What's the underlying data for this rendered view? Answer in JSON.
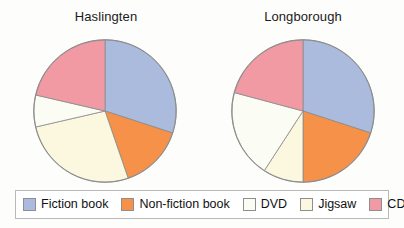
{
  "charts": [
    {
      "title": "Haslingten"
    },
    {
      "title": "Longborough"
    }
  ],
  "legend": {
    "items": [
      {
        "label": "Fiction book",
        "color": "#aabbdd"
      },
      {
        "label": "Non-fiction book",
        "color": "#f59149"
      },
      {
        "label": "DVD",
        "color": "#fbfdf5"
      },
      {
        "label": "Jigsaw",
        "color": "#fcf8e0"
      },
      {
        "label": "CD",
        "color": "#f29aa4"
      }
    ]
  },
  "chart_data": [
    {
      "type": "pie",
      "title": "Haslingten",
      "categories": [
        "Fiction book",
        "Non-fiction book",
        "Jigsaw",
        "DVD",
        "CD"
      ],
      "values": [
        30,
        15,
        26.5,
        7,
        21.5
      ],
      "units": "percent",
      "start_angle_deg": 0,
      "direction": "clockwise",
      "colors": [
        "#aabbdd",
        "#f59149",
        "#fcf8e0",
        "#fbfdf5",
        "#f29aa4"
      ],
      "slice_angles_deg": [
        {
          "name": "Fiction book",
          "start": 0,
          "end": 108
        },
        {
          "name": "Non-fiction book",
          "start": 108,
          "end": 161
        },
        {
          "name": "Jigsaw",
          "start": 161,
          "end": 257
        },
        {
          "name": "DVD",
          "start": 257,
          "end": 283
        },
        {
          "name": "CD",
          "start": 283,
          "end": 360
        }
      ],
      "legend_position": "bottom"
    },
    {
      "type": "pie",
      "title": "Longborough",
      "categories": [
        "Fiction book",
        "Non-fiction book",
        "Jigsaw",
        "DVD",
        "CD"
      ],
      "values": [
        30,
        20,
        9,
        20,
        21
      ],
      "units": "percent",
      "start_angle_deg": 0,
      "direction": "clockwise",
      "colors": [
        "#aabbdd",
        "#f59149",
        "#fcf8e0",
        "#fbfdf5",
        "#f29aa4"
      ],
      "slice_angles_deg": [
        {
          "name": "Fiction book",
          "start": 0,
          "end": 108
        },
        {
          "name": "Non-fiction book",
          "start": 108,
          "end": 180
        },
        {
          "name": "Jigsaw",
          "start": 180,
          "end": 213
        },
        {
          "name": "DVD",
          "start": 213,
          "end": 285
        },
        {
          "name": "CD",
          "start": 285,
          "end": 360
        }
      ],
      "legend_position": "bottom"
    }
  ]
}
